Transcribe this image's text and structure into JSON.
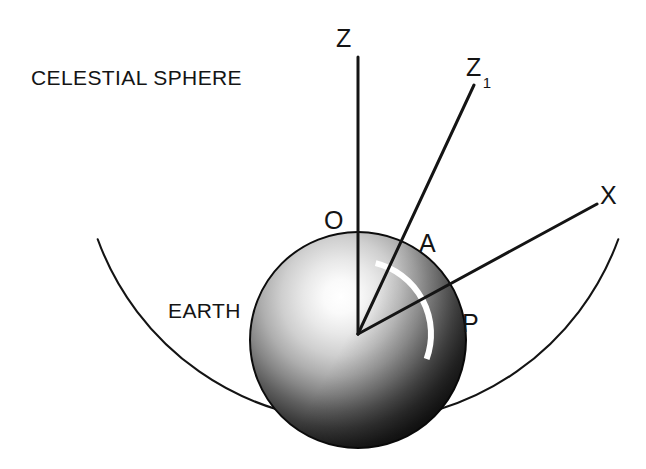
{
  "figure": {
    "background_color": "#ffffff",
    "stroke_color": "#141414",
    "arc_marker_color": "#ffffff",
    "width": 646,
    "height": 469
  },
  "captions": {
    "celestial_sphere": "CELESTIAL SPHERE",
    "earth": "EARTH"
  },
  "points": {
    "zenith": "Z",
    "zenith_sub": "Z",
    "zenith_sub_index": "1",
    "star": "X",
    "observer": "O",
    "azimuth_point": "A",
    "pole_point": "P"
  },
  "geometry": {
    "center": {
      "x": 358,
      "y": 334
    },
    "earth_radius": 108,
    "celestial_radius": 277,
    "celestial_arc_start_deg": 160,
    "celestial_arc_end_deg": 20,
    "rays": [
      {
        "name": "OZ",
        "to": {
          "x": 358,
          "y": 57
        }
      },
      {
        "name": "OZ1",
        "to": {
          "x": 474,
          "y": 85
        }
      },
      {
        "name": "OX",
        "to": {
          "x": 597,
          "y": 204
        }
      }
    ],
    "angle_marker": {
      "name": "angle-AOP",
      "radius": 73,
      "start_deg": -76,
      "end_deg": 20,
      "stroke_width": 6
    }
  }
}
